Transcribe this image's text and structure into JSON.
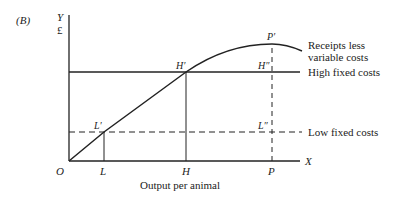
{
  "figure": {
    "panel_label": "(B)",
    "y_axis": {
      "label": "Y",
      "unit": "£"
    },
    "x_axis": {
      "label": "X",
      "title": "Output per animal",
      "origin": "O"
    },
    "x_ticks": [
      "L",
      "H",
      "P"
    ],
    "points": {
      "L_prime": "L′",
      "H_prime": "H′",
      "P_prime": "P′",
      "H_double_prime": "H″",
      "L_double_prime": "L″"
    },
    "curves": {
      "receipts_line1": "Receipts less",
      "receipts_line2": "variable costs",
      "high_fixed": "High fixed costs",
      "low_fixed": "Low fixed costs"
    },
    "colors": {
      "ink": "#222222",
      "background": "#ffffff"
    }
  }
}
